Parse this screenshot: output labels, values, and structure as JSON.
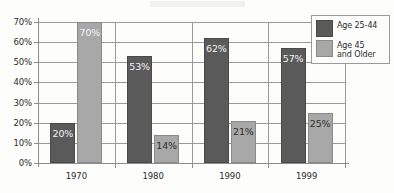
{
  "chart_data": {
    "type": "bar",
    "title": "",
    "subtitle": "",
    "xlabel": "",
    "ylabel": "",
    "categories": [
      "1970",
      "1980",
      "1990",
      "1999"
    ],
    "series": [
      {
        "name": "Age 25-44",
        "color": "#5a5a5a",
        "values": [
          20,
          53,
          62,
          57
        ],
        "labels": [
          "20%",
          "53%",
          "62%",
          "57%"
        ],
        "label_style": [
          "on-dark",
          "on-dark",
          "on-dark",
          "on-dark"
        ]
      },
      {
        "name": "Age 45\nand Older",
        "color": "#a8a8a8",
        "values": [
          70,
          14,
          21,
          25
        ],
        "labels": [
          "70%",
          "14%",
          "21%",
          "25%"
        ],
        "label_style": [
          "on-dark",
          "on-light",
          "on-light",
          "on-light"
        ]
      }
    ],
    "ylim": [
      0,
      70
    ],
    "ytick_values": [
      0,
      10,
      20,
      30,
      40,
      50,
      60,
      70
    ],
    "ytick_labels": [
      "0%",
      "10%",
      "20%",
      "30%",
      "40%",
      "50%",
      "60%",
      "70%"
    ],
    "grid": true,
    "grid_axis": "y",
    "legend_position": "top-right",
    "legend_entries": [
      "Age 25-44",
      "Age 45\nand Older"
    ],
    "group_separators": true
  },
  "colors": {
    "series_dark": "#5a5a5a",
    "series_light": "#a8a8a8",
    "axis": "#8d8d8d",
    "grid": "#9a9a9a",
    "text": "#2b2b2b",
    "background": "#fdfdfb"
  }
}
